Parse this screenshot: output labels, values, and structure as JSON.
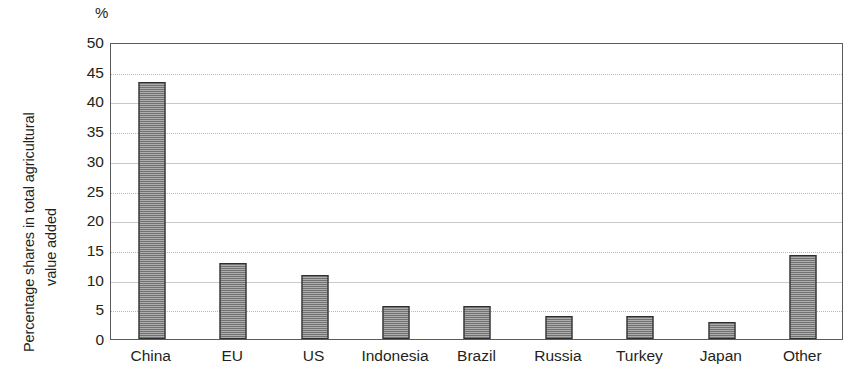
{
  "chart_data": {
    "type": "bar",
    "title": "",
    "subtitle": "",
    "unit_label": "%",
    "xlabel": "",
    "ylabel": "Percentage shares in total agricultural value added",
    "ylabel_lines": [
      "Percentage shares in total agricultural",
      "value added"
    ],
    "categories": [
      "China",
      "EU",
      "US",
      "Indonesia",
      "Brazil",
      "Russia",
      "Turkey",
      "Japan",
      "Other"
    ],
    "values": [
      43.2,
      12.8,
      10.7,
      5.5,
      5.6,
      3.9,
      3.9,
      2.9,
      14.2
    ],
    "series": [
      {
        "name": "Percentage shares in total agricultural value added",
        "values": [
          43.2,
          12.8,
          10.7,
          5.5,
          5.6,
          3.9,
          3.9,
          2.9,
          14.2
        ]
      }
    ],
    "ylim": [
      0,
      50
    ],
    "ytick_step": 5,
    "yticks": [
      50,
      45,
      40,
      35,
      30,
      25,
      20,
      15,
      10,
      5,
      0
    ],
    "ytick_labels": [
      "50",
      "45",
      "40",
      "35",
      "30",
      "25",
      "20",
      "15",
      "10",
      "5",
      "0"
    ],
    "grid": true,
    "grid_axis": "y",
    "legend": false,
    "legend_position": "none",
    "annotations": [],
    "colors": {
      "bar_fill": "#4d4d4d",
      "bar_edge": "#2e2e2e",
      "plot_border": "#5b5b5b",
      "gridline": "#b9b9b9",
      "background": "#ffffff",
      "text": "#231f20"
    }
  }
}
